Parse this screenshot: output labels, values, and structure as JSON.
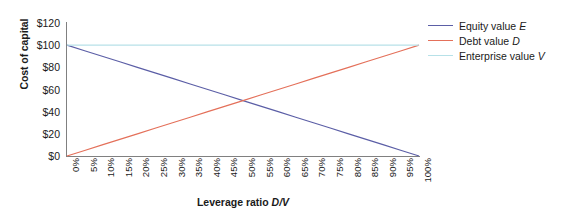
{
  "chart_data": {
    "type": "line",
    "title": "",
    "xlabel": "Leverage ratio D/V",
    "xlabel_plain": "Leverage ratio ",
    "xlabel_italic": "D/V",
    "ylabel": "Cost of capital",
    "xlim": [
      0,
      100
    ],
    "ylim": [
      0,
      120
    ],
    "grid": false,
    "legend_position": "right",
    "x": [
      0,
      5,
      10,
      15,
      20,
      25,
      30,
      35,
      40,
      45,
      50,
      55,
      60,
      65,
      70,
      75,
      80,
      85,
      90,
      95,
      100
    ],
    "categories": [
      "0%",
      "5%",
      "10%",
      "15%",
      "20%",
      "25%",
      "30%",
      "35%",
      "40%",
      "45%",
      "50%",
      "55%",
      "60%",
      "65%",
      "70%",
      "75%",
      "80%",
      "85%",
      "90%",
      "95%",
      "100%"
    ],
    "ytick_values": [
      0,
      20,
      40,
      60,
      80,
      100,
      120
    ],
    "ytick_labels": [
      "$0",
      "$20",
      "$40",
      "$60",
      "$80",
      "$100",
      "$120"
    ],
    "series": [
      {
        "name": "Equity value E",
        "name_plain": "Equity value ",
        "name_italic": "E",
        "color": "#5b5ea6",
        "values": [
          100,
          95,
          90,
          85,
          80,
          75,
          70,
          65,
          60,
          55,
          50,
          45,
          40,
          35,
          30,
          25,
          20,
          15,
          10,
          5,
          0
        ]
      },
      {
        "name": "Debt value D",
        "name_plain": "Debt value ",
        "name_italic": "D",
        "color": "#e4705a",
        "values": [
          0,
          5,
          10,
          15,
          20,
          25,
          30,
          35,
          40,
          45,
          50,
          55,
          60,
          65,
          70,
          75,
          80,
          85,
          90,
          95,
          100
        ]
      },
      {
        "name": "Enterprise value V",
        "name_plain": "Enterprise value ",
        "name_italic": "V",
        "color": "#b7e1e8",
        "values": [
          100,
          100,
          100,
          100,
          100,
          100,
          100,
          100,
          100,
          100,
          100,
          100,
          100,
          100,
          100,
          100,
          100,
          100,
          100,
          100,
          100
        ]
      }
    ],
    "annotations": []
  },
  "axis": {
    "spine_color": "#808080",
    "tick_color": "#808080"
  }
}
